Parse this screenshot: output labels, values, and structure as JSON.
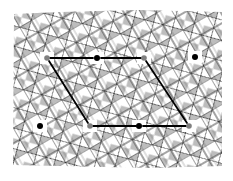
{
  "diagram": {
    "type": "periodic tiling with unit cell",
    "colors": {
      "background": "#ffffff",
      "tile_line": "#1a1a1a",
      "tile_fill_gray": "#bdbdbd",
      "cell_line": "#000000",
      "dot_black": "#000000",
      "dot_gray": "#808080"
    },
    "tiling": {
      "bounds": {
        "x": 13,
        "y": 10,
        "width": 209,
        "height": 158
      },
      "rotation_deg": -30,
      "square_size": 14
    },
    "unit_cell": {
      "lines": [
        {
          "x1": 50,
          "y1": 58,
          "x2": 93,
          "y2": 58
        },
        {
          "x1": 101,
          "y1": 58,
          "x2": 141,
          "y2": 58
        },
        {
          "x1": 93,
          "y1": 126,
          "x2": 136,
          "y2": 126
        },
        {
          "x1": 143,
          "y1": 126,
          "x2": 186,
          "y2": 126
        },
        {
          "x1": 49,
          "y1": 61,
          "x2": 88,
          "y2": 123
        },
        {
          "x1": 146,
          "y1": 61,
          "x2": 187,
          "y2": 123
        }
      ],
      "points": [
        {
          "x": 47,
          "y": 58,
          "kind": "gray"
        },
        {
          "x": 97,
          "y": 58,
          "kind": "black"
        },
        {
          "x": 144,
          "y": 58,
          "kind": "gray"
        },
        {
          "x": 195,
          "y": 57,
          "kind": "black"
        },
        {
          "x": 40,
          "y": 126,
          "kind": "black"
        },
        {
          "x": 90,
          "y": 126,
          "kind": "gray"
        },
        {
          "x": 139,
          "y": 126,
          "kind": "black"
        },
        {
          "x": 189,
          "y": 126,
          "kind": "gray"
        }
      ]
    }
  }
}
